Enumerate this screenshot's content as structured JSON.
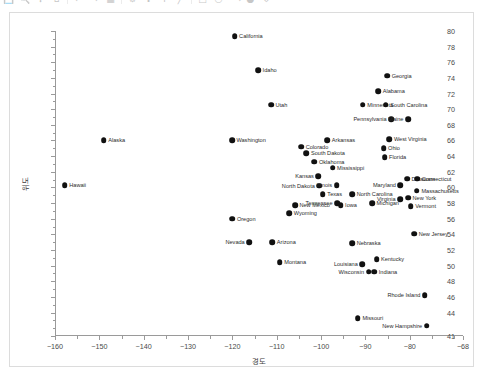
{
  "toolbar": {
    "icons": [
      "save-icon",
      "zoom-icon",
      "pan-icon",
      "home-icon",
      "back-icon",
      "forward-icon",
      "grid-icon",
      "settings-icon",
      "crosshair-icon",
      "text-icon",
      "line-icon",
      "rect-icon",
      "circle-icon",
      "arrow-icon",
      "color-icon",
      "export-icon"
    ]
  },
  "chart_data": {
    "type": "scatter",
    "title": "",
    "xlabel": "경도",
    "ylabel": "위도",
    "xlim": [
      -160,
      -68
    ],
    "ylim": [
      41,
      80
    ],
    "xticks": [
      -160,
      -150,
      -140,
      -130,
      -120,
      -110,
      -100,
      -90,
      -80,
      -68
    ],
    "yticks": [
      41,
      44,
      46,
      48,
      50,
      52,
      54,
      56,
      58,
      60,
      62,
      64,
      66,
      68,
      70,
      72,
      74,
      76,
      78,
      80
    ],
    "grid": false,
    "legend": null,
    "marker_color": "#111111",
    "points": [
      {
        "label": "Hawaii",
        "x": -157.8,
        "y": 60.3,
        "side": "right"
      },
      {
        "label": "Alaska",
        "x": -149.0,
        "y": 66.0,
        "side": "right"
      },
      {
        "label": "California",
        "x": -119.5,
        "y": 79.3,
        "side": "right"
      },
      {
        "label": "Idaho",
        "x": -114.2,
        "y": 75.0,
        "side": "right"
      },
      {
        "label": "Utah",
        "x": -111.3,
        "y": 70.6,
        "side": "right"
      },
      {
        "label": "Washington",
        "x": -120.1,
        "y": 66.0,
        "side": "right"
      },
      {
        "label": "Oregon",
        "x": -120.0,
        "y": 56.0,
        "side": "right"
      },
      {
        "label": "Nevada",
        "x": -116.2,
        "y": 53.0,
        "side": "left"
      },
      {
        "label": "Arizona",
        "x": -111.0,
        "y": 53.0,
        "side": "right"
      },
      {
        "label": "Montana",
        "x": -109.3,
        "y": 50.4,
        "side": "right"
      },
      {
        "label": "Wyoming",
        "x": -107.2,
        "y": 56.7,
        "side": "right"
      },
      {
        "label": "New Mexico",
        "x": -105.9,
        "y": 57.7,
        "side": "right"
      },
      {
        "label": "Colorado",
        "x": -104.5,
        "y": 65.2,
        "side": "right"
      },
      {
        "label": "South Dakota",
        "x": -103.3,
        "y": 64.4,
        "side": "right"
      },
      {
        "label": "North Dakota",
        "x": -100.4,
        "y": 60.2,
        "side": "left"
      },
      {
        "label": "Oklahoma",
        "x": -101.5,
        "y": 63.3,
        "side": "right"
      },
      {
        "label": "Kansas",
        "x": -100.6,
        "y": 61.4,
        "side": "left"
      },
      {
        "label": "Texas",
        "x": -99.6,
        "y": 59.1,
        "side": "right"
      },
      {
        "label": "Arkansas",
        "x": -98.6,
        "y": 66.0,
        "side": "right"
      },
      {
        "label": "Nebraska",
        "x": -93.0,
        "y": 52.9,
        "side": "right"
      },
      {
        "label": "Iowa",
        "x": -95.6,
        "y": 57.7,
        "side": "right"
      },
      {
        "label": "Tennessee",
        "x": -96.4,
        "y": 58.0,
        "side": "left"
      },
      {
        "label": "Illinois",
        "x": -96.5,
        "y": 60.3,
        "side": "left"
      },
      {
        "label": "Mississippi",
        "x": -97.4,
        "y": 62.5,
        "side": "right"
      },
      {
        "label": "Minnesota",
        "x": -90.6,
        "y": 70.6,
        "side": "right"
      },
      {
        "label": "Georgia",
        "x": -85.1,
        "y": 74.3,
        "side": "right"
      },
      {
        "label": "Alabama",
        "x": -87.1,
        "y": 72.3,
        "side": "right"
      },
      {
        "label": "South Carolina",
        "x": -85.4,
        "y": 70.6,
        "side": "right"
      },
      {
        "label": "Pennsylvania",
        "x": -84.2,
        "y": 68.7,
        "side": "left"
      },
      {
        "label": "Maine",
        "x": -80.4,
        "y": 68.7,
        "side": "left"
      },
      {
        "label": "West Virginia",
        "x": -84.6,
        "y": 66.2,
        "side": "right"
      },
      {
        "label": "Ohio",
        "x": -85.9,
        "y": 65.0,
        "side": "right"
      },
      {
        "label": "Florida",
        "x": -85.7,
        "y": 63.9,
        "side": "right"
      },
      {
        "label": "Delaware",
        "x": -80.6,
        "y": 61.1,
        "side": "right"
      },
      {
        "label": "Connecticut",
        "x": -78.3,
        "y": 61.1,
        "side": "right"
      },
      {
        "label": "Maryland",
        "x": -82.1,
        "y": 60.3,
        "side": "left"
      },
      {
        "label": "Massachusetts",
        "x": -78.4,
        "y": 59.6,
        "side": "right"
      },
      {
        "label": "North Carolina",
        "x": -93.0,
        "y": 59.1,
        "side": "right"
      },
      {
        "label": "Virginia",
        "x": -82.2,
        "y": 58.5,
        "side": "left"
      },
      {
        "label": "New York",
        "x": -80.4,
        "y": 58.7,
        "side": "right"
      },
      {
        "label": "Michigan",
        "x": -88.5,
        "y": 58.0,
        "side": "right"
      },
      {
        "label": "Vermont",
        "x": -79.8,
        "y": 57.6,
        "side": "right"
      },
      {
        "label": "New Jersey",
        "x": -79.0,
        "y": 54.1,
        "side": "right"
      },
      {
        "label": "Kentucky",
        "x": -87.5,
        "y": 50.8,
        "side": "right"
      },
      {
        "label": "Louisiana",
        "x": -90.7,
        "y": 50.2,
        "side": "left"
      },
      {
        "label": "Wisconsin",
        "x": -89.3,
        "y": 49.2,
        "side": "left"
      },
      {
        "label": "Indiana",
        "x": -88.0,
        "y": 49.2,
        "side": "right"
      },
      {
        "label": "Rhode Island",
        "x": -76.6,
        "y": 46.2,
        "side": "left"
      },
      {
        "label": "Missouri",
        "x": -91.7,
        "y": 43.3,
        "side": "right"
      },
      {
        "label": "New Hampshire",
        "x": -76.2,
        "y": 42.3,
        "side": "left"
      }
    ]
  }
}
